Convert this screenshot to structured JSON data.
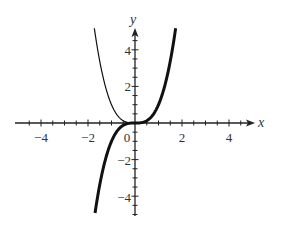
{
  "chart_data": {
    "type": "line",
    "title": "",
    "xlabel": "x",
    "ylabel": "y",
    "xlim": [
      -5,
      5
    ],
    "ylim": [
      -5,
      5
    ],
    "x_ticks": [
      -4,
      -2,
      0,
      2,
      4
    ],
    "y_ticks": [
      -4,
      -2,
      2,
      4
    ],
    "x_tick_labels": [
      "−4",
      "−2",
      "0",
      "2",
      "4"
    ],
    "y_tick_labels": [
      "−4",
      "−2",
      "2",
      "4"
    ],
    "minor_tick_step": 0.5,
    "grid": false,
    "legend": null,
    "series": [
      {
        "name": "y = |x|^3 (left branch, thin)",
        "style": "thin",
        "x": [
          -1.73,
          -1.6,
          -1.4,
          -1.2,
          -1.0,
          -0.8,
          -0.6,
          -0.4,
          -0.2,
          0.0
        ],
        "y": [
          5.18,
          4.1,
          2.74,
          1.73,
          1.0,
          0.51,
          0.22,
          0.06,
          0.01,
          0.0
        ]
      },
      {
        "name": "y = x^3 (thick)",
        "style": "thick",
        "x": [
          -1.7,
          -1.5,
          -1.2,
          -1.0,
          -0.8,
          -0.5,
          -0.2,
          0.0,
          0.2,
          0.5,
          0.8,
          1.0,
          1.2,
          1.5,
          1.73
        ],
        "y": [
          -4.91,
          -3.38,
          -1.73,
          -1.0,
          -0.51,
          -0.13,
          -0.01,
          0.0,
          0.01,
          0.13,
          0.51,
          1.0,
          1.73,
          3.38,
          5.18
        ]
      }
    ]
  },
  "axes": {
    "x_name": "x",
    "y_name": "y",
    "color": "#222222"
  },
  "colors": {
    "curve": "#111111",
    "background": "#ffffff"
  }
}
